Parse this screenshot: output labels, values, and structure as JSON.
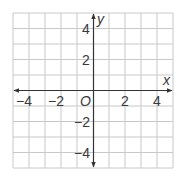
{
  "diagram": {
    "type": "coordinate-grid",
    "x_axis": {
      "label": "x",
      "min": -5,
      "max": 5,
      "tick_labels": [
        "−4",
        "−2",
        "2",
        "4"
      ],
      "tick_values": [
        -4,
        -2,
        2,
        4
      ]
    },
    "y_axis": {
      "label": "y",
      "min": -5,
      "max": 5,
      "tick_labels": [
        "4",
        "2",
        "−2",
        "−4"
      ],
      "tick_values": [
        4,
        2,
        -2,
        -4
      ]
    },
    "origin_label": "O",
    "grid": {
      "cells_x": 10,
      "cells_y": 10,
      "line_color": "#c8c8c8",
      "axis_color": "#333333"
    }
  }
}
